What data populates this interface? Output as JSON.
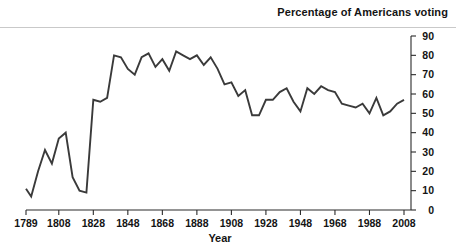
{
  "chart_data": {
    "type": "line",
    "title": "Percentage of Americans voting",
    "xlabel": "Year",
    "ylabel": "",
    "grid": false,
    "legend": "none",
    "y_axis_position": "right",
    "xlim": [
      1789,
      2008
    ],
    "ylim": [
      0,
      90
    ],
    "yticks": [
      90,
      80,
      70,
      60,
      50,
      40,
      30,
      20,
      10,
      0
    ],
    "xticks": [
      1789,
      1808,
      1828,
      1848,
      1868,
      1888,
      1908,
      1928,
      1948,
      1968,
      1988,
      2008
    ],
    "line_color": "#3a3a3a",
    "series": [
      {
        "name": "Percentage of Americans voting",
        "x": [
          1789,
          1792,
          1796,
          1800,
          1804,
          1808,
          1812,
          1816,
          1820,
          1824,
          1828,
          1832,
          1836,
          1840,
          1844,
          1848,
          1852,
          1856,
          1860,
          1864,
          1868,
          1872,
          1876,
          1880,
          1884,
          1888,
          1892,
          1896,
          1900,
          1904,
          1908,
          1912,
          1916,
          1920,
          1924,
          1928,
          1932,
          1936,
          1940,
          1944,
          1948,
          1952,
          1956,
          1960,
          1964,
          1968,
          1972,
          1976,
          1980,
          1984,
          1988,
          1992,
          1996,
          2000,
          2004,
          2008
        ],
        "values": [
          11,
          7,
          20,
          31,
          24,
          37,
          40,
          17,
          10,
          9,
          57,
          56,
          58,
          80,
          79,
          73,
          70,
          79,
          81,
          74,
          78,
          72,
          82,
          80,
          78,
          80,
          75,
          79,
          73,
          65,
          66,
          59,
          62,
          49,
          49,
          57,
          57,
          61,
          63,
          56,
          51,
          63,
          60,
          64,
          62,
          61,
          55,
          54,
          53,
          55,
          50,
          58,
          49,
          51,
          55,
          57
        ]
      }
    ]
  },
  "axes": {
    "title_text": "Percentage of Americans voting",
    "xlabel_text": "Year"
  }
}
